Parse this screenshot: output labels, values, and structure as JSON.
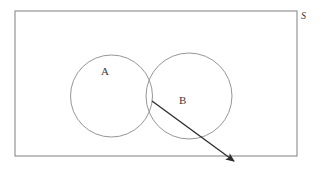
{
  "figure": {
    "type": "venn-diagram",
    "background_color": "#ffffff",
    "stroke_color": "#8a8a8a",
    "arrow_color": "#2b2b2b",
    "text_color": "#3a3a3a",
    "universe": {
      "name": "sample-space",
      "label": "S",
      "shape": "rectangle",
      "x": 15,
      "y": 11,
      "width": 282,
      "height": 145,
      "label_x": 306,
      "label_y": 17
    },
    "sets": [
      {
        "id": "A",
        "label": "A",
        "shape": "circle",
        "cx": 111.5,
        "cy": 96,
        "r": 41,
        "label_x": 106,
        "label_y": 72
      },
      {
        "id": "B",
        "label": "B",
        "shape": "circle",
        "cx": 189,
        "cy": 96,
        "r": 43,
        "label_x": 184,
        "label_y": 101
      }
    ],
    "intersection": {
      "name": "A-intersect-B",
      "top_point": {
        "x": 148,
        "y": 65
      },
      "bottom_point": {
        "x": 148,
        "y": 126
      }
    },
    "annotation_arrow": {
      "name": "intersection-pointer",
      "from_x": 152,
      "from_y": 101,
      "to_x": 238,
      "to_y": 164,
      "points_to": "A-intersect-B",
      "head_style": "filled-triangle",
      "label": ""
    }
  }
}
